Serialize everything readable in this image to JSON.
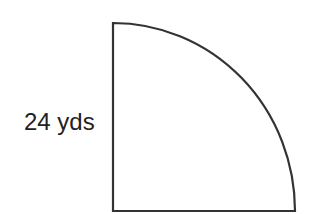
{
  "diagram": {
    "shape": "quarter-circle",
    "side_label": "24 yds",
    "stroke_color": "#333333",
    "fill_color": "#ffffff",
    "corner": {
      "x": 113,
      "y": 211
    },
    "top": {
      "x": 113,
      "y": 23
    },
    "right": {
      "x": 295,
      "y": 211
    }
  }
}
